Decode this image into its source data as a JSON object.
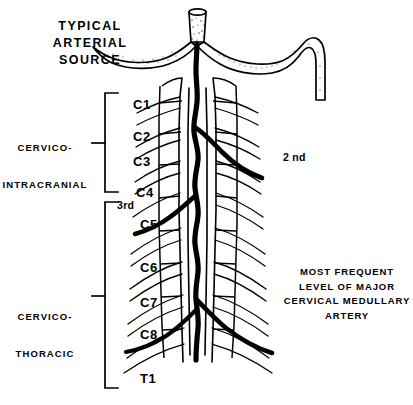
{
  "figure": {
    "title_lines": [
      "TYPICAL",
      "ARTERIAL",
      "SOURCE"
    ],
    "ink_color": "#000000",
    "background_color": "#ffffff"
  },
  "regions": [
    {
      "id": "cervico-intracranial",
      "lines": [
        "CERVICO-",
        "INTRACRANIAL"
      ],
      "bracket_top": 93,
      "bracket_bottom": 192
    },
    {
      "id": "cervico-thoracic",
      "lines": [
        "CERVICO-",
        "THORACIC"
      ],
      "bracket_top": 202,
      "bracket_bottom": 388
    }
  ],
  "levels": [
    {
      "label": "C1",
      "y": 105
    },
    {
      "label": "C2",
      "y": 137
    },
    {
      "label": "C3",
      "y": 162
    },
    {
      "label": "C4",
      "y": 193
    },
    {
      "label": "C5",
      "y": 225
    },
    {
      "label": "C6",
      "y": 268
    },
    {
      "label": "C7",
      "y": 303
    },
    {
      "label": "C8",
      "y": 335
    },
    {
      "label": "T1",
      "y": 379
    }
  ],
  "ordinals": [
    {
      "label": "3rd",
      "x": 117,
      "y": 206
    },
    {
      "label": "2 nd",
      "x": 283,
      "y": 157
    }
  ],
  "annotation": {
    "lines": [
      "MOST FREQUENT",
      "LEVEL OF MAJOR",
      "CERVICAL MEDULLARY",
      "ARTERY"
    ]
  }
}
